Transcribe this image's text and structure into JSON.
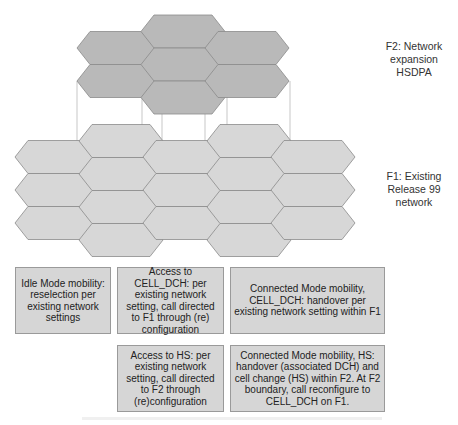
{
  "diagram": {
    "colors": {
      "f2_fill": "#b9b9b9",
      "f1_fill": "#d7d7d7",
      "hex_stroke": "#8a8a8a",
      "connector": "#b0b0b0",
      "box_fill": "#d6d6d6"
    },
    "layers": {
      "f2": {
        "label": "F2: Network expansion HSDPA",
        "lines": [
          "F2: Network",
          "expansion",
          "HSDPA"
        ]
      },
      "f1": {
        "label": "F1: Existing Release 99 network",
        "lines": [
          "F1: Existing",
          "Release 99",
          "network"
        ]
      }
    },
    "boxes": [
      {
        "id": "idle-mode",
        "text": "Idle Mode mobility: reselection per existing network settings"
      },
      {
        "id": "access-cell-dch",
        "text": "Access to CELL_DCH: per existing network setting, call directed to F1 through (re) configuration"
      },
      {
        "id": "connected-cell-dch",
        "text": "Connected Mode mobility, CELL_DCH: handover per existing network setting within F1"
      },
      {
        "id": "access-hs",
        "text": "Access to HS: per existing network setting, call directed to F2 through (re)configuration"
      },
      {
        "id": "connected-hs",
        "text": "Connected Mode mobility, HS: handover (associated DCH) and cell change (HS) within F2. At F2 boundary, call reconfigure to CELL_DCH on F1."
      }
    ]
  }
}
